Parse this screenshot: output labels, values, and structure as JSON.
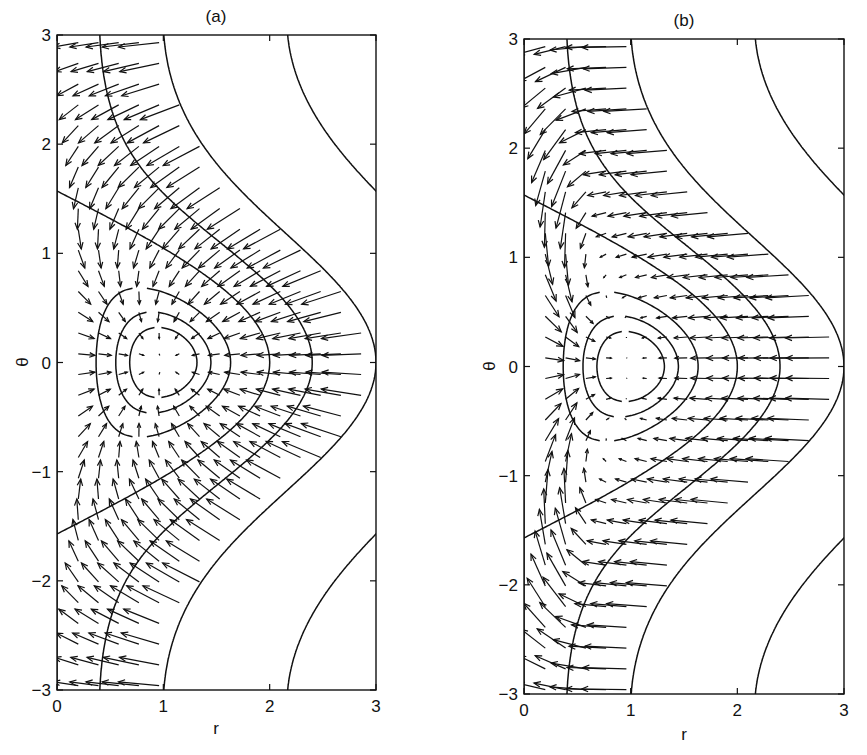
{
  "chart_data": [
    {
      "type": "quiver+contour",
      "panel": "(a)",
      "title": "(a)",
      "xlabel": "r",
      "ylabel": "θ",
      "xlim": [
        0,
        3
      ],
      "ylim": [
        -3,
        3
      ],
      "xticks": [
        0,
        1,
        2,
        3
      ],
      "yticks": [
        -3,
        -2,
        -1,
        0,
        1,
        2,
        3
      ],
      "grid": false,
      "contour_function": "H(r,θ) = r²/2 − r·cos θ",
      "contour_levels": [
        -0.45,
        -0.4,
        -0.3,
        0,
        0.48,
        1.5,
        4.5
      ],
      "contour_crossings_theta0_r": [
        [
          0.68,
          1.31
        ],
        [
          0.55,
          1.44
        ],
        [
          0.35,
          1.63
        ],
        [
          2.0
        ],
        [
          2.4
        ],
        [
          3.0
        ]
      ],
      "vector_field": "−∇H (toward closed orbits' center at r=1, θ=0)",
      "vector_grid": {
        "r_start": 0.2,
        "r_step": 0.19,
        "theta_step": 0.19,
        "region": "H ≤ 1.5"
      }
    },
    {
      "type": "quiver+contour",
      "panel": "(b)",
      "title": "(b)",
      "xlabel": "r",
      "ylabel": "θ",
      "xlim": [
        0,
        3
      ],
      "ylim": [
        -3,
        3
      ],
      "xticks": [
        0,
        1,
        2,
        3
      ],
      "yticks": [
        -3,
        -2,
        -1,
        0,
        1,
        2,
        3
      ],
      "grid": false,
      "contour_function": "H(r,θ) = r²/2 − r·cos θ",
      "contour_levels": [
        -0.45,
        -0.4,
        -0.3,
        0,
        0.48,
        1.5,
        4.5
      ],
      "contour_crossings_theta0_r": [
        [
          0.68,
          1.31
        ],
        [
          0.55,
          1.44
        ],
        [
          0.35,
          1.63
        ],
        [
          2.0
        ],
        [
          2.4
        ],
        [
          3.0
        ]
      ],
      "vector_field": "modified field: mainly −r direction for large r, θ-convergent toward θ=0 near r≈0.2–0.5",
      "vector_grid": {
        "r_start": 0.2,
        "r_step": 0.19,
        "theta_step": 0.19,
        "region": "H ≤ 1.5"
      }
    }
  ],
  "panels": [
    {
      "title": "(a)",
      "xlabel": "r",
      "ylabel": "θ",
      "xticklabels": [
        "0",
        "1",
        "2",
        "3"
      ],
      "yticklabels": [
        "3",
        "2",
        "1",
        "0",
        "−1",
        "−2",
        "−3"
      ]
    },
    {
      "title": "(b)",
      "xlabel": "r",
      "ylabel": "θ",
      "xticklabels": [
        "0",
        "1",
        "2",
        "3"
      ],
      "yticklabels": [
        "3",
        "2",
        "1",
        "0",
        "−1",
        "−2",
        "−3"
      ]
    }
  ],
  "layout": {
    "panel_boxes": [
      {
        "x0": 57,
        "x1": 376,
        "y0": 35,
        "y1": 690
      },
      {
        "x0": 524,
        "x1": 844,
        "y0": 39,
        "y1": 694
      }
    ],
    "line_color": "#111111",
    "background": "#ffffff"
  }
}
